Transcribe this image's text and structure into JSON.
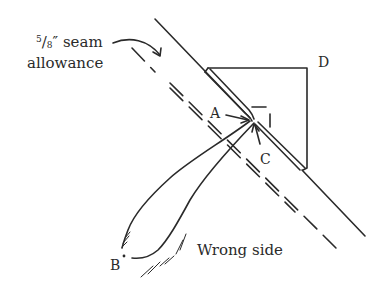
{
  "diagram": {
    "type": "sewing-illustration",
    "stroke_color": "#2a2a2a",
    "background": "#ffffff",
    "labels": {
      "seam_allowance_fraction_num": "5",
      "seam_allowance_fraction_slash": "/",
      "seam_allowance_fraction_den": "8",
      "seam_allowance_unit": "″ seam",
      "seam_allowance_line2": "allowance",
      "point_a": "A",
      "point_b": "B",
      "point_c": "C",
      "point_d": "D",
      "wrong_side": "Wrong side"
    }
  }
}
